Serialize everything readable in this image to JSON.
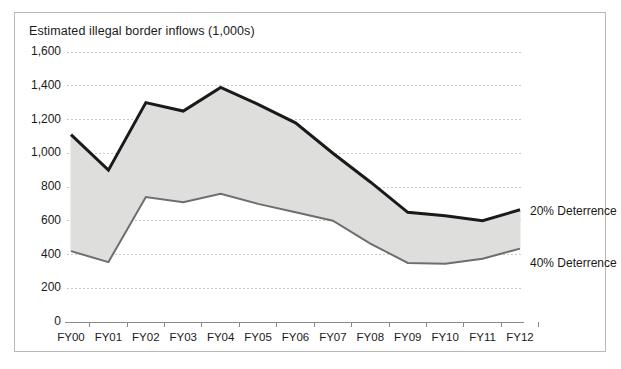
{
  "figure": {
    "title": "Estimated illegal border inflows (1,000s)",
    "frame_color": "#b9b9b9",
    "background": "#ffffff"
  },
  "chart_data": {
    "type": "line",
    "title": "Estimated illegal border inflows (1,000s)",
    "xlabel": "",
    "ylabel": "",
    "ylim": [
      0,
      1600
    ],
    "ytick_labels": [
      "1,600",
      "1,400",
      "1,200",
      "1,000",
      "800",
      "600",
      "400",
      "200",
      "0"
    ],
    "ytick_values": [
      1600,
      1400,
      1200,
      1000,
      800,
      600,
      400,
      200,
      0
    ],
    "grid": true,
    "grid_style": "dotted",
    "grid_color": "#c8c8c8",
    "legend_position": "right-inline",
    "band_fill": "#dededc",
    "categories": [
      "FY00",
      "FY01",
      "FY02",
      "FY03",
      "FY04",
      "FY05",
      "FY06",
      "FY07",
      "FY08",
      "FY09",
      "FY10",
      "FY11",
      "FY12"
    ],
    "series": [
      {
        "name": "20% Deterrence",
        "color": "#1a1a1a",
        "line_width": 3,
        "values": [
          1110,
          900,
          1300,
          1250,
          1390,
          1290,
          1180,
          1000,
          830,
          650,
          630,
          600,
          665
        ]
      },
      {
        "name": "40% Deterrence",
        "color": "#6e6e6e",
        "line_width": 2,
        "values": [
          420,
          355,
          740,
          710,
          760,
          700,
          650,
          600,
          465,
          350,
          345,
          375,
          435
        ]
      }
    ],
    "annotations": [
      {
        "text": "20% Deterrence",
        "x": 530,
        "y": 212
      },
      {
        "text": "40% Deterrence",
        "x": 530,
        "y": 264
      }
    ]
  }
}
